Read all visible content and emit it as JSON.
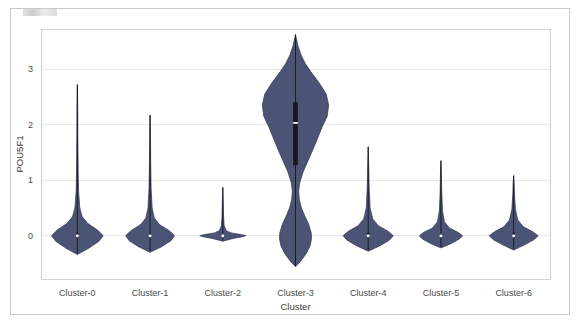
{
  "figure": {
    "background_color": "#ffffff",
    "frame_color": "#c9c9c9",
    "plot_border_color": "#d2d2d2",
    "grid_color": "#e9e9e9",
    "violin_fill": "#4c5476",
    "violin_edge": "#2f3550",
    "box_color": "#16161c",
    "median_color": "#ffffff"
  },
  "chart_data": {
    "type": "violin",
    "title": "",
    "xlabel": "Cluster",
    "ylabel": "POU5F1",
    "categories": [
      "Cluster-0",
      "Cluster-1",
      "Cluster-2",
      "Cluster-3",
      "Cluster-4",
      "Cluster-5",
      "Cluster-6"
    ],
    "ytick_labels": [
      "0",
      "1",
      "2",
      "3"
    ],
    "ytick_values": [
      0,
      1,
      2,
      3
    ],
    "ylim": [
      -0.78,
      3.72
    ],
    "grid": true,
    "legend": null,
    "series": [
      {
        "name": "Cluster-0",
        "median": 0.0,
        "q1": -0.03,
        "q3": 0.05,
        "whisker_low": -0.32,
        "whisker_high": 2.72,
        "data_min": -0.32,
        "data_max": 2.72,
        "max_width": 0.74,
        "density": [
          {
            "y": -0.34,
            "w": 0.0
          },
          {
            "y": -0.22,
            "w": 0.34
          },
          {
            "y": -0.1,
            "w": 0.62
          },
          {
            "y": 0.0,
            "w": 0.74
          },
          {
            "y": 0.1,
            "w": 0.58
          },
          {
            "y": 0.22,
            "w": 0.3
          },
          {
            "y": 0.34,
            "w": 0.14
          },
          {
            "y": 0.5,
            "w": 0.07
          },
          {
            "y": 0.8,
            "w": 0.035
          },
          {
            "y": 1.2,
            "w": 0.022
          },
          {
            "y": 1.8,
            "w": 0.014
          },
          {
            "y": 2.3,
            "w": 0.01
          },
          {
            "y": 2.72,
            "w": 0.0
          }
        ]
      },
      {
        "name": "Cluster-1",
        "median": 0.0,
        "q1": -0.03,
        "q3": 0.04,
        "whisker_low": -0.28,
        "whisker_high": 2.17,
        "data_min": -0.28,
        "data_max": 2.17,
        "max_width": 0.7,
        "density": [
          {
            "y": -0.3,
            "w": 0.0
          },
          {
            "y": -0.2,
            "w": 0.33
          },
          {
            "y": -0.09,
            "w": 0.6
          },
          {
            "y": 0.0,
            "w": 0.7
          },
          {
            "y": 0.09,
            "w": 0.55
          },
          {
            "y": 0.2,
            "w": 0.27
          },
          {
            "y": 0.32,
            "w": 0.12
          },
          {
            "y": 0.5,
            "w": 0.06
          },
          {
            "y": 0.85,
            "w": 0.03
          },
          {
            "y": 1.3,
            "w": 0.018
          },
          {
            "y": 1.75,
            "w": 0.012
          },
          {
            "y": 2.17,
            "w": 0.0
          }
        ]
      },
      {
        "name": "Cluster-2",
        "median": 0.0,
        "q1": -0.01,
        "q3": 0.01,
        "whisker_low": -0.09,
        "whisker_high": 0.87,
        "data_min": -0.09,
        "data_max": 0.87,
        "max_width": 0.66,
        "density": [
          {
            "y": -0.1,
            "w": 0.0
          },
          {
            "y": -0.05,
            "w": 0.3
          },
          {
            "y": -0.02,
            "w": 0.56
          },
          {
            "y": 0.0,
            "w": 0.66
          },
          {
            "y": 0.02,
            "w": 0.52
          },
          {
            "y": 0.05,
            "w": 0.24
          },
          {
            "y": 0.09,
            "w": 0.1
          },
          {
            "y": 0.18,
            "w": 0.04
          },
          {
            "y": 0.35,
            "w": 0.022
          },
          {
            "y": 0.6,
            "w": 0.014
          },
          {
            "y": 0.87,
            "w": 0.0
          }
        ]
      },
      {
        "name": "Cluster-3",
        "median": 2.03,
        "q1": 1.27,
        "q3": 2.4,
        "whisker_low": -0.55,
        "whisker_high": 3.62,
        "data_min": -0.55,
        "data_max": 3.62,
        "max_width": 0.95,
        "bimodal": true,
        "density": [
          {
            "y": -0.56,
            "w": 0.0
          },
          {
            "y": -0.45,
            "w": 0.16
          },
          {
            "y": -0.32,
            "w": 0.31
          },
          {
            "y": -0.18,
            "w": 0.42
          },
          {
            "y": -0.05,
            "w": 0.46
          },
          {
            "y": 0.05,
            "w": 0.45
          },
          {
            "y": 0.2,
            "w": 0.38
          },
          {
            "y": 0.35,
            "w": 0.27
          },
          {
            "y": 0.5,
            "w": 0.17
          },
          {
            "y": 0.65,
            "w": 0.11
          },
          {
            "y": 0.8,
            "w": 0.09
          },
          {
            "y": 0.95,
            "w": 0.12
          },
          {
            "y": 1.15,
            "w": 0.22
          },
          {
            "y": 1.35,
            "w": 0.36
          },
          {
            "y": 1.55,
            "w": 0.5
          },
          {
            "y": 1.75,
            "w": 0.63
          },
          {
            "y": 1.95,
            "w": 0.76
          },
          {
            "y": 2.15,
            "w": 0.91
          },
          {
            "y": 2.35,
            "w": 0.95
          },
          {
            "y": 2.55,
            "w": 0.88
          },
          {
            "y": 2.75,
            "w": 0.68
          },
          {
            "y": 2.95,
            "w": 0.44
          },
          {
            "y": 3.1,
            "w": 0.28
          },
          {
            "y": 3.25,
            "w": 0.16
          },
          {
            "y": 3.42,
            "w": 0.07
          },
          {
            "y": 3.62,
            "w": 0.0
          }
        ]
      },
      {
        "name": "Cluster-4",
        "median": 0.0,
        "q1": -0.03,
        "q3": 0.05,
        "whisker_low": -0.26,
        "whisker_high": 1.6,
        "data_min": -0.26,
        "data_max": 1.6,
        "max_width": 0.72,
        "density": [
          {
            "y": -0.28,
            "w": 0.0
          },
          {
            "y": -0.18,
            "w": 0.34
          },
          {
            "y": -0.08,
            "w": 0.61
          },
          {
            "y": 0.0,
            "w": 0.72
          },
          {
            "y": 0.08,
            "w": 0.57
          },
          {
            "y": 0.18,
            "w": 0.29
          },
          {
            "y": 0.3,
            "w": 0.13
          },
          {
            "y": 0.5,
            "w": 0.055
          },
          {
            "y": 0.85,
            "w": 0.028
          },
          {
            "y": 1.2,
            "w": 0.016
          },
          {
            "y": 1.6,
            "w": 0.0
          }
        ]
      },
      {
        "name": "Cluster-5",
        "median": 0.0,
        "q1": -0.02,
        "q3": 0.03,
        "whisker_low": -0.2,
        "whisker_high": 1.35,
        "data_min": -0.2,
        "data_max": 1.35,
        "max_width": 0.62,
        "density": [
          {
            "y": -0.22,
            "w": 0.0
          },
          {
            "y": -0.14,
            "w": 0.3
          },
          {
            "y": -0.06,
            "w": 0.53
          },
          {
            "y": 0.0,
            "w": 0.62
          },
          {
            "y": 0.06,
            "w": 0.49
          },
          {
            "y": 0.14,
            "w": 0.24
          },
          {
            "y": 0.25,
            "w": 0.1
          },
          {
            "y": 0.45,
            "w": 0.045
          },
          {
            "y": 0.8,
            "w": 0.022
          },
          {
            "y": 1.1,
            "w": 0.014
          },
          {
            "y": 1.35,
            "w": 0.0
          }
        ]
      },
      {
        "name": "Cluster-6",
        "median": 0.0,
        "q1": -0.03,
        "q3": 0.05,
        "whisker_low": -0.24,
        "whisker_high": 1.08,
        "data_min": -0.24,
        "data_max": 1.08,
        "max_width": 0.7,
        "density": [
          {
            "y": -0.26,
            "w": 0.0
          },
          {
            "y": -0.16,
            "w": 0.33
          },
          {
            "y": -0.07,
            "w": 0.59
          },
          {
            "y": 0.0,
            "w": 0.7
          },
          {
            "y": 0.07,
            "w": 0.55
          },
          {
            "y": 0.16,
            "w": 0.28
          },
          {
            "y": 0.28,
            "w": 0.12
          },
          {
            "y": 0.48,
            "w": 0.05
          },
          {
            "y": 0.75,
            "w": 0.024
          },
          {
            "y": 0.95,
            "w": 0.014
          },
          {
            "y": 1.08,
            "w": 0.0
          }
        ]
      }
    ]
  }
}
